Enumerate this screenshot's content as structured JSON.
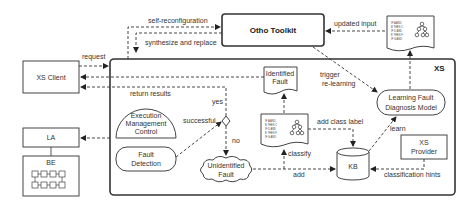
{
  "nodes": {
    "otho_toolkit": "Otho Toolkit",
    "xs_client": "XS Client",
    "la": "LA",
    "be": "BE",
    "xs_container": "XS",
    "identified_fault": [
      "Identified",
      "Fault"
    ],
    "execution_management_control": [
      "Execution",
      "Management",
      "Control"
    ],
    "fault_detection": [
      "Fault",
      "Detection"
    ],
    "unidentified_fault": [
      "Unidentified",
      "Fault"
    ],
    "learning_fault_diagnosis_model": [
      "Learning Fault",
      "Diagnosis Model"
    ],
    "kb": "KB",
    "xs_provider": [
      "XS",
      "Provider"
    ]
  },
  "rule_document": {
    "lines": [
      "IF A AND",
      "B THEN C",
      "IF D AND",
      "E THEN F",
      "IF G AND"
    ]
  },
  "edges": {
    "self_reconfiguration": "self-reconfiguration",
    "synthesize_and_replace": "synthesize and replace",
    "updated_input": "updated input",
    "request": "request",
    "return_results": "return results",
    "trigger_relearning": [
      "trigger",
      "re-learning"
    ],
    "yes": "yes",
    "no": "no",
    "successful": "successful",
    "add_class_label": "add class label",
    "classify": "classify",
    "add": "add",
    "learn": "learn",
    "classification_hints": "classification hints"
  }
}
